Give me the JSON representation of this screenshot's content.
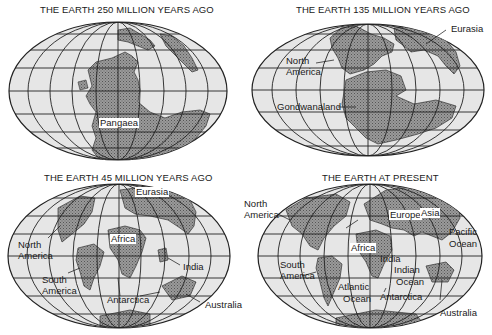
{
  "figure": {
    "panels": [
      {
        "title": "THE EARTH 250 MILLION YEARS AGO",
        "labels": [
          "Pangaea"
        ]
      },
      {
        "title": "THE EARTH 135 MILLION YEARS AGO",
        "labels": [
          "Eurasia",
          "North",
          "America",
          "Gondwanaland"
        ]
      },
      {
        "title": "THE EARTH 45 MILLION YEARS AGO",
        "labels": [
          "Eurasia",
          "Africa",
          "North",
          "America",
          "South",
          "America",
          "India",
          "Antarctica",
          "Australia"
        ]
      },
      {
        "title": "THE EARTH AT PRESENT",
        "labels": [
          "North",
          "America",
          "Europe",
          "Asia",
          "Pacific",
          "Ocean",
          "Africa",
          "India",
          "South",
          "America",
          "Indian",
          "Ocean",
          "Atlantic",
          "Ocean",
          "Antarctica",
          "Australia"
        ]
      }
    ],
    "colors": {
      "ocean": "#e4e4e4",
      "land": "#8a8a8a",
      "grid": "#222222",
      "outline": "#222222"
    }
  }
}
